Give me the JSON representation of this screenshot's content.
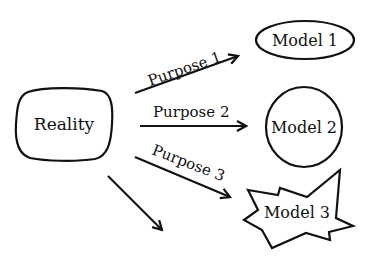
{
  "diagram": {
    "source": {
      "label": "Reality"
    },
    "edges": [
      {
        "label": "Purpose 1",
        "target": "Model 1"
      },
      {
        "label": "Purpose 2",
        "target": "Model 2"
      },
      {
        "label": "Purpose 3",
        "target": "Model 3"
      },
      {
        "label": "",
        "target": ""
      }
    ],
    "models": [
      {
        "label": "Model 1",
        "shape": "ellipse"
      },
      {
        "label": "Model 2",
        "shape": "circle"
      },
      {
        "label": "Model 3",
        "shape": "star"
      }
    ]
  },
  "colors": {
    "stroke": "#111111",
    "background": "#ffffff"
  }
}
